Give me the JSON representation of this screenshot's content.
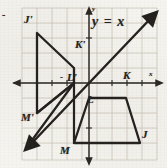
{
  "figure": {
    "kind": "coordinate-geometry-diagram",
    "line_equation": "y = x",
    "axis_labels": {
      "x": "x",
      "y": "y"
    },
    "negative_sign": "-"
  },
  "grid": {
    "cell_px": 15,
    "origin_px": {
      "x": 89,
      "y": 83
    },
    "left_px": 22,
    "right_px": 157,
    "top_px": 8,
    "bottom_px": 160,
    "color": "#b9b4a6"
  },
  "axes": {
    "x_axis_y_px": 83,
    "y_axis_x_px": 89,
    "color": "#2b2724"
  },
  "line_yx": {
    "label": "y = x",
    "from_px": {
      "x": 27,
      "y": 148
    },
    "to_px": {
      "x": 155,
      "y": 14
    },
    "color": "#23201e"
  },
  "preimage": {
    "name": "JKLM",
    "color": "#24211f",
    "vertices": [
      {
        "label": "J",
        "point_px": {
          "x": 140,
          "y": 143
        },
        "label_px": {
          "x": 141,
          "y": 134
        }
      },
      {
        "label": "K",
        "point_px": {
          "x": 126,
          "y": 98
        },
        "label_px": {
          "x": 124,
          "y": 74
        }
      },
      {
        "label": "L",
        "point_px": {
          "x": 89,
          "y": 98
        },
        "label_px": {
          "x": 88,
          "y": 98
        }
      },
      {
        "label": "M",
        "point_px": {
          "x": 74,
          "y": 143
        },
        "label_px": {
          "x": 61,
          "y": 150
        }
      }
    ]
  },
  "image": {
    "name": "J'K'L'M'",
    "color": "#24211f",
    "vertices": [
      {
        "label": "J'",
        "point_px": {
          "x": 37,
          "y": 33
        },
        "label_px": {
          "x": 25,
          "y": 20
        }
      },
      {
        "label": "K'",
        "point_px": {
          "x": 74,
          "y": 68
        },
        "label_px": {
          "x": 76,
          "y": 44
        }
      },
      {
        "label": "L'",
        "point_px": {
          "x": 74,
          "y": 83
        },
        "label_px": {
          "x": 68,
          "y": 76
        }
      },
      {
        "label": "M'",
        "point_px": {
          "x": 37,
          "y": 113
        },
        "label_px": {
          "x": 22,
          "y": 117
        }
      }
    ]
  },
  "marks": {
    "corner_dash": "-"
  }
}
